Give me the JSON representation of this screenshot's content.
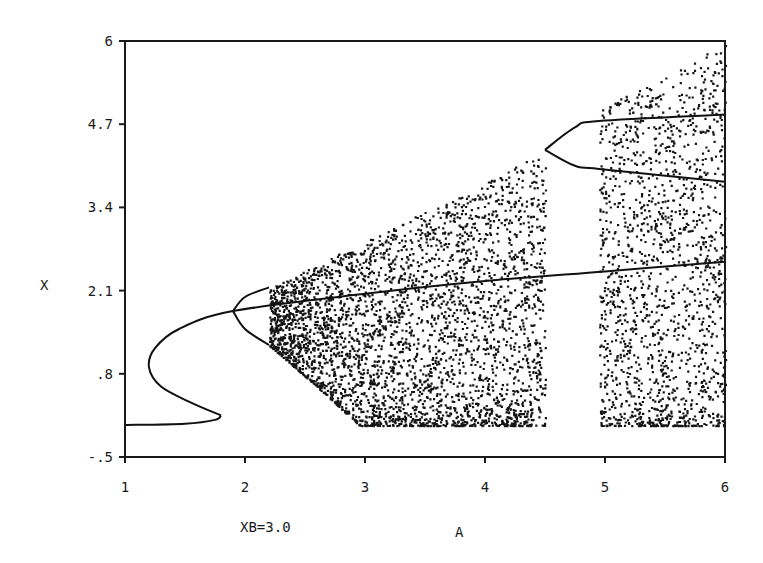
{
  "chart_data": {
    "type": "scatter",
    "title": "",
    "xlabel": "A",
    "ylabel": "X",
    "annotation": "XB=3.0",
    "xlim": [
      1,
      6
    ],
    "ylim": [
      -0.5,
      6
    ],
    "x_ticks": [
      "1",
      "2",
      "3",
      "4",
      "5",
      "6"
    ],
    "y_ticks": [
      "-.5",
      ".8",
      "2.1",
      "3.4",
      "4.7",
      "6"
    ],
    "grid": false,
    "legend": null,
    "series": [
      {
        "name": "lower fixed branch",
        "kind": "line",
        "points": [
          [
            1.0,
            0.0
          ],
          [
            1.5,
            0.02
          ],
          [
            1.75,
            0.08
          ],
          [
            1.8,
            0.15
          ]
        ]
      },
      {
        "name": "S-shaped fixed-point curve",
        "kind": "line",
        "points": [
          [
            1.8,
            0.15
          ],
          [
            1.55,
            0.35
          ],
          [
            1.3,
            0.6
          ],
          [
            1.2,
            0.9
          ],
          [
            1.25,
            1.2
          ],
          [
            1.45,
            1.5
          ],
          [
            1.9,
            1.78
          ],
          [
            3.0,
            2.05
          ],
          [
            4.0,
            2.25
          ],
          [
            5.0,
            2.4
          ],
          [
            6.0,
            2.55
          ]
        ]
      },
      {
        "name": "period-2 upper branch",
        "kind": "line",
        "points": [
          [
            1.9,
            1.78
          ],
          [
            2.0,
            2.0
          ],
          [
            2.2,
            2.15
          ]
        ]
      },
      {
        "name": "period-2 lower branch",
        "kind": "line",
        "points": [
          [
            1.9,
            1.78
          ],
          [
            2.0,
            1.5
          ],
          [
            2.2,
            1.25
          ]
        ]
      },
      {
        "name": "chaotic band 1",
        "kind": "scatter-region",
        "a_range": [
          2.2,
          4.5
        ],
        "upper_bound": [
          [
            2.2,
            2.15
          ],
          [
            3.0,
            2.9
          ],
          [
            4.0,
            3.8
          ],
          [
            4.5,
            4.3
          ]
        ],
        "lower_bound": [
          [
            2.2,
            1.25
          ],
          [
            2.6,
            0.6
          ],
          [
            2.95,
            0.0
          ],
          [
            4.5,
            0.0
          ]
        ]
      },
      {
        "name": "periodic window branches",
        "kind": "line",
        "points_upper": [
          [
            4.5,
            4.3
          ],
          [
            4.75,
            4.65
          ],
          [
            4.95,
            4.75
          ],
          [
            6.0,
            4.85
          ]
        ],
        "points_lower": [
          [
            4.5,
            4.3
          ],
          [
            4.75,
            4.05
          ],
          [
            4.95,
            4.0
          ],
          [
            6.0,
            3.8
          ]
        ]
      },
      {
        "name": "chaotic band 2",
        "kind": "scatter-region",
        "a_range": [
          4.95,
          6.0
        ],
        "upper_bound": [
          [
            4.95,
            4.95
          ],
          [
            5.5,
            5.45
          ],
          [
            6.0,
            6.0
          ]
        ],
        "lower_bound": [
          [
            4.95,
            0.0
          ],
          [
            6.0,
            0.0
          ]
        ]
      }
    ]
  }
}
